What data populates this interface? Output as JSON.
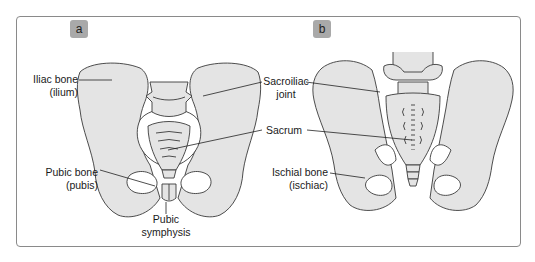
{
  "figure": {
    "panels": [
      {
        "id": "a",
        "badge": "a",
        "view": "anterior"
      },
      {
        "id": "b",
        "badge": "b",
        "view": "posterior"
      }
    ],
    "labels": {
      "iliac": {
        "line1": "Iliac bone",
        "line2": "(ilium)"
      },
      "sacroiliac": {
        "line1": "Sacroiliac",
        "line2": "joint"
      },
      "sacrum": {
        "line1": "Sacrum"
      },
      "pubic_bone": {
        "line1": "Pubic bone",
        "line2": "(pubis)"
      },
      "pubic_symphysis": {
        "line1": "Pubic",
        "line2": "symphysis"
      },
      "ischial": {
        "line1": "Ischial bone",
        "line2": "(ischiac)"
      }
    },
    "colors": {
      "bone_fill": "#e4e4e4",
      "outline": "#3a3a3a",
      "badge_bg": "#a9a9a9",
      "frame_border": "#8a8a8a"
    }
  }
}
